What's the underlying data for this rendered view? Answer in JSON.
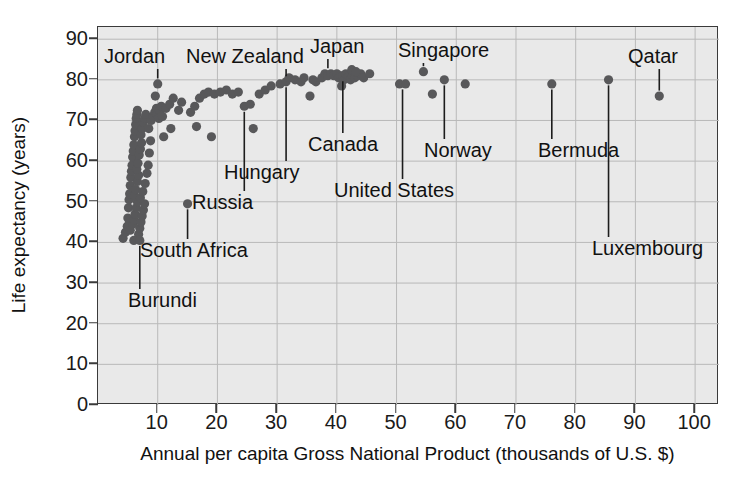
{
  "chart_data": {
    "type": "scatter",
    "title": "",
    "xlabel": "Annual per capita Gross National Product (thousands of U.S. $)",
    "ylabel": "Life expectancy (years)",
    "xlim": [
      0,
      104
    ],
    "ylim": [
      0,
      93
    ],
    "xticks": [
      10,
      20,
      30,
      40,
      50,
      60,
      70,
      80,
      90,
      100
    ],
    "yticks": [
      0,
      10,
      20,
      30,
      40,
      50,
      60,
      70,
      80,
      90
    ],
    "grid": true,
    "legend": "none",
    "points": [
      [
        4.2,
        41.0
      ],
      [
        4.6,
        42.5
      ],
      [
        4.9,
        44.0
      ],
      [
        5.0,
        46.0
      ],
      [
        5.1,
        48.5
      ],
      [
        5.2,
        50.5
      ],
      [
        5.3,
        52.0
      ],
      [
        5.4,
        54.0
      ],
      [
        5.5,
        56.0
      ],
      [
        5.6,
        57.5
      ],
      [
        5.7,
        59.0
      ],
      [
        5.8,
        61.0
      ],
      [
        5.9,
        62.5
      ],
      [
        6.0,
        64.0
      ],
      [
        6.1,
        66.0
      ],
      [
        6.2,
        67.5
      ],
      [
        6.3,
        69.0
      ],
      [
        6.4,
        70.5
      ],
      [
        6.5,
        71.5
      ],
      [
        6.6,
        72.5
      ],
      [
        5.4,
        43.0
      ],
      [
        5.8,
        44.5
      ],
      [
        6.0,
        45.5
      ],
      [
        6.2,
        47.0
      ],
      [
        6.4,
        48.5
      ],
      [
        6.6,
        50.0
      ],
      [
        6.1,
        51.5
      ],
      [
        6.3,
        53.0
      ],
      [
        6.6,
        55.0
      ],
      [
        6.8,
        56.5
      ],
      [
        6.5,
        58.0
      ],
      [
        6.7,
        59.5
      ],
      [
        6.9,
        61.5
      ],
      [
        7.1,
        63.0
      ],
      [
        7.3,
        64.5
      ],
      [
        7.2,
        66.5
      ],
      [
        7.4,
        68.0
      ],
      [
        7.6,
        69.5
      ],
      [
        7.8,
        70.5
      ],
      [
        8.0,
        71.5
      ],
      [
        6.8,
        42.0
      ],
      [
        7.0,
        43.5
      ],
      [
        7.2,
        45.0
      ],
      [
        7.4,
        46.5
      ],
      [
        7.6,
        48.0
      ],
      [
        7.8,
        49.5
      ],
      [
        7.1,
        51.0
      ],
      [
        7.5,
        52.5
      ],
      [
        7.9,
        54.5
      ],
      [
        8.2,
        57.0
      ],
      [
        8.4,
        59.0
      ],
      [
        8.6,
        62.0
      ],
      [
        8.8,
        65.0
      ],
      [
        8.5,
        68.0
      ],
      [
        8.9,
        70.0
      ],
      [
        9.2,
        71.0
      ],
      [
        9.5,
        72.0
      ],
      [
        9.8,
        73.0
      ],
      [
        6.0,
        40.5
      ],
      [
        7.0,
        40.5
      ],
      [
        9.6,
        76.0
      ],
      [
        10.0,
        79.0
      ],
      [
        9.9,
        71.5
      ],
      [
        10.3,
        72.5
      ],
      [
        10.6,
        73.5
      ],
      [
        10.2,
        70.5
      ],
      [
        10.8,
        71.0
      ],
      [
        11.4,
        73.0
      ],
      [
        12.0,
        74.0
      ],
      [
        12.6,
        75.5
      ],
      [
        11.0,
        66.0
      ],
      [
        12.2,
        68.0
      ],
      [
        13.5,
        72.5
      ],
      [
        14.0,
        74.5
      ],
      [
        15.0,
        49.5
      ],
      [
        15.5,
        72.0
      ],
      [
        16.2,
        73.5
      ],
      [
        17.0,
        75.5
      ],
      [
        17.8,
        76.5
      ],
      [
        18.5,
        77.0
      ],
      [
        16.5,
        68.5
      ],
      [
        19.0,
        66.0
      ],
      [
        19.5,
        76.5
      ],
      [
        20.5,
        77.0
      ],
      [
        21.5,
        77.5
      ],
      [
        22.5,
        76.5
      ],
      [
        23.5,
        77.0
      ],
      [
        24.5,
        73.5
      ],
      [
        25.5,
        74.0
      ],
      [
        26.0,
        68.0
      ],
      [
        27.0,
        76.5
      ],
      [
        28.0,
        77.5
      ],
      [
        29.0,
        78.5
      ],
      [
        30.5,
        79.0
      ],
      [
        31.5,
        79.5
      ],
      [
        32.0,
        80.5
      ],
      [
        33.0,
        80.0
      ],
      [
        34.0,
        79.5
      ],
      [
        35.5,
        76.0
      ],
      [
        36.5,
        79.5
      ],
      [
        37.5,
        80.5
      ],
      [
        38.0,
        81.5
      ],
      [
        38.5,
        81.0
      ],
      [
        39.0,
        81.5
      ],
      [
        39.5,
        81.0
      ],
      [
        40.0,
        81.5
      ],
      [
        40.3,
        80.5
      ],
      [
        40.6,
        81.0
      ],
      [
        41.0,
        81.0
      ],
      [
        41.2,
        80.0
      ],
      [
        41.5,
        81.5
      ],
      [
        41.8,
        80.5
      ],
      [
        42.0,
        81.0
      ],
      [
        42.3,
        80.0
      ],
      [
        42.6,
        81.0
      ],
      [
        43.0,
        80.5
      ],
      [
        43.5,
        81.0
      ],
      [
        44.0,
        81.5
      ],
      [
        44.5,
        80.5
      ],
      [
        45.5,
        81.5
      ],
      [
        40.8,
        78.5
      ],
      [
        42.5,
        82.5
      ],
      [
        43.2,
        82.0
      ],
      [
        36.0,
        80.0
      ],
      [
        34.5,
        80.5
      ],
      [
        50.5,
        79.0
      ],
      [
        51.5,
        79.0
      ],
      [
        54.5,
        82.0
      ],
      [
        56.0,
        76.5
      ],
      [
        58.0,
        80.0
      ],
      [
        61.5,
        79.0
      ],
      [
        76.0,
        79.0
      ],
      [
        85.5,
        80.0
      ],
      [
        94.0,
        76.0
      ]
    ],
    "annotations": [
      {
        "name": "Jordan",
        "label_x": 104,
        "label_y": 46,
        "point": [
          10.0,
          79.0
        ],
        "leader": true
      },
      {
        "name": "New Zealand",
        "label_x": 186,
        "label_y": 46,
        "point": [
          31.5,
          79.5
        ],
        "leader": true
      },
      {
        "name": "Japan",
        "label_x": 310,
        "label_y": 36,
        "point": [
          38.5,
          81.5
        ],
        "leader": true
      },
      {
        "name": "Singapore",
        "label_x": 398,
        "label_y": 40,
        "point": [
          54.5,
          82.0
        ],
        "leader": true
      },
      {
        "name": "Qatar",
        "label_x": 628,
        "label_y": 46,
        "point": [
          94.0,
          76.0
        ],
        "leader": true
      },
      {
        "name": "Canada",
        "label_x": 308,
        "label_y": 134,
        "point": [
          41.0,
          81.0
        ],
        "leader": true
      },
      {
        "name": "Norway",
        "label_x": 424,
        "label_y": 140,
        "point": [
          58.0,
          80.0
        ],
        "leader": true
      },
      {
        "name": "Hungary",
        "label_x": 224,
        "label_y": 162,
        "point": [
          31.5,
          79.5
        ],
        "leader": true
      },
      {
        "name": "Bermuda",
        "label_x": 538,
        "label_y": 140,
        "point": [
          76.0,
          79.0
        ],
        "leader": true
      },
      {
        "name": "Russia",
        "label_x": 192,
        "label_y": 192,
        "point": [
          24.5,
          73.5
        ],
        "leader": true
      },
      {
        "name": "United States",
        "label_x": 334,
        "label_y": 180,
        "point": [
          51.0,
          79.0
        ],
        "leader": true
      },
      {
        "name": "Luxembourg",
        "label_x": 592,
        "label_y": 238,
        "point": [
          85.5,
          80.0
        ],
        "leader": true
      },
      {
        "name": "South Africa",
        "label_x": 140,
        "label_y": 240,
        "point": [
          15.0,
          49.5
        ],
        "leader": true
      },
      {
        "name": "Burundi",
        "label_x": 128,
        "label_y": 290,
        "point": [
          7.0,
          40.5
        ],
        "leader": true
      }
    ]
  },
  "colors": {
    "plot_background": "#e9e9e9",
    "point_color": "#58585a",
    "grid_color": "#b9b9b9",
    "axis_color": "#3a3a3a",
    "text_color": "#111111"
  }
}
